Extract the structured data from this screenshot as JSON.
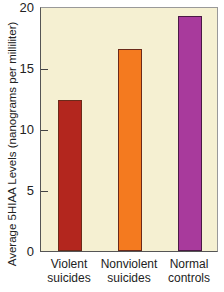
{
  "chart_data": {
    "type": "bar",
    "title": "",
    "categories": [
      "Violent suicides",
      "Nonviolent suicides",
      "Normal controls"
    ],
    "category_lines": [
      [
        "Violent",
        "suicides"
      ],
      [
        "Nonviolent",
        "suicides"
      ],
      [
        "Normal",
        "controls"
      ]
    ],
    "values": [
      12.4,
      16.6,
      19.3
    ],
    "colors": [
      "#b3261e",
      "#f47a1f",
      "#a83a9c"
    ],
    "xlabel": "",
    "ylabel": "Average 5HIAA Levels (nanograms per milliliter)",
    "ylim": [
      0,
      20
    ],
    "yticks": [
      "0",
      "5",
      "10",
      "15",
      "20"
    ],
    "grid": false,
    "legend": "none",
    "plot_background": "#f5f0d2"
  }
}
